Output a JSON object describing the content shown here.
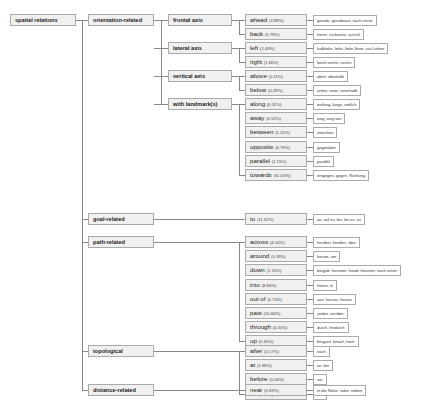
{
  "root": "spatial relations",
  "categories": [
    {
      "label": "orientation-related",
      "subs": [
        {
          "label": "frontal axis",
          "items": [
            {
              "w": "ahead",
              "p": "(3.88%)",
              "t": "gerade, geradeaus, nach vorne"
            },
            {
              "w": "back",
              "p": "(0.79%)",
              "t": "hinter, rückwärts, zurück"
            }
          ]
        },
        {
          "label": "lateral axis",
          "items": [
            {
              "w": "left",
              "p": "(1.49%)",
              "t": "halblinks, links, linke Seite, zur Linken"
            },
            {
              "w": "right",
              "p": "(1.80%)",
              "t": "leicht rechts, rechts"
            }
          ]
        },
        {
          "label": "vertical axis",
          "items": [
            {
              "w": "above",
              "p": "(0.11%)",
              "t": "oben, oberhalb"
            },
            {
              "w": "below",
              "p": "(0.28%)",
              "t": "unten, unter, unterhalb"
            }
          ]
        },
        {
          "label": "with landmark(s)",
          "items": [
            {
              "w": "along",
              "p": "(6.32%)",
              "t": "entlang, längs, seitlich"
            },
            {
              "w": "away",
              "p": "(0.51%)",
              "t": "weg, weg von"
            },
            {
              "w": "between",
              "p": "(1.24%)",
              "t": "zwischen"
            },
            {
              "w": "opposite",
              "p": "(0.79%)",
              "t": "gegenüber"
            },
            {
              "w": "parallel",
              "p": "(1.15%)",
              "t": "parallel"
            },
            {
              "w": "towards",
              "p": "(31.63%)",
              "t": "entgegen, gegen, Richtung"
            }
          ]
        }
      ]
    },
    {
      "label": "goal-related",
      "items": [
        {
          "w": "to",
          "p": "(11.52%)",
          "t": "an, auf zu, bis, bis zu, zu"
        }
      ]
    },
    {
      "label": "path-related",
      "items": [
        {
          "w": "across",
          "p": "(4.16%)",
          "t": "herüber, hinüber, über"
        },
        {
          "w": "around",
          "p": "(0.39%)",
          "t": "herum, um"
        },
        {
          "w": "down",
          "p": "(1.15%)",
          "t": "bergab, herunter, hinab, hinunter, nach unten"
        },
        {
          "w": "into",
          "p": "(8.86%)",
          "t": "hinein, in"
        },
        {
          "w": "out of",
          "p": "(0.73%)",
          "t": "aus, heraus, hinaus"
        },
        {
          "w": "past",
          "p": "(10.66%)",
          "t": "vorbei, vorüber"
        },
        {
          "w": "through",
          "p": "(4.30%)",
          "t": "durch, hindurch"
        },
        {
          "w": "up",
          "p": "(0.45%)",
          "t": "bergauf, hinauf, hoch"
        }
      ]
    },
    {
      "label": "topological",
      "items": [
        {
          "w": "after",
          "p": "(0.17%)",
          "t": "nach"
        },
        {
          "w": "at",
          "p": "(1.88%)",
          "t": "an, bei"
        },
        {
          "w": "before",
          "p": "(0.06%)",
          "t": "vor"
        },
        {
          "w": "on",
          "p": "(2.67%)",
          "t": "auf"
        }
      ]
    },
    {
      "label": "distance-related",
      "items": [
        {
          "w": "near",
          "p": "(0.93%)",
          "t": "in der Nähe, nahe, neben"
        }
      ]
    }
  ]
}
